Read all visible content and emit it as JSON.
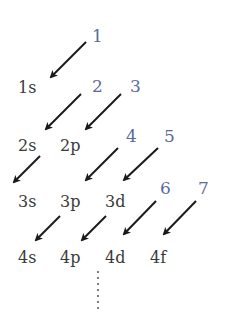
{
  "diagram": {
    "orbitals": [
      {
        "label": "1s",
        "x": 18,
        "y": 80
      },
      {
        "label": "2s",
        "x": 18,
        "y": 138
      },
      {
        "label": "2p",
        "x": 60,
        "y": 138
      },
      {
        "label": "3s",
        "x": 18,
        "y": 194
      },
      {
        "label": "3p",
        "x": 60,
        "y": 194
      },
      {
        "label": "3d",
        "x": 105,
        "y": 194
      },
      {
        "label": "4s",
        "x": 18,
        "y": 250
      },
      {
        "label": "4p",
        "x": 60,
        "y": 250
      },
      {
        "label": "4d",
        "x": 105,
        "y": 250
      },
      {
        "label": "4f",
        "x": 150,
        "y": 250
      }
    ],
    "order_numbers": [
      {
        "label": "1",
        "x": 92,
        "y": 28
      },
      {
        "label": "2",
        "x": 92,
        "y": 78
      },
      {
        "label": "3",
        "x": 130,
        "y": 78
      },
      {
        "label": "4",
        "x": 126,
        "y": 128
      },
      {
        "label": "5",
        "x": 164,
        "y": 128
      },
      {
        "label": "6",
        "x": 160,
        "y": 180
      },
      {
        "label": "7",
        "x": 198,
        "y": 180
      }
    ],
    "ellipsis": "⋮",
    "colors": {
      "label": "#3a3a3a",
      "number": "#5a6a9a",
      "arrow": "#1a1a1a"
    }
  }
}
